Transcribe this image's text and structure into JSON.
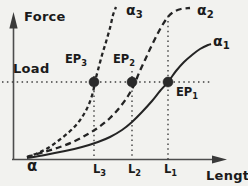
{
  "colors": {
    "background": "#f2f2ef",
    "ink": "#242424",
    "axis": "#4d4d4d",
    "dot": "#2a2a2a"
  },
  "axis_labels": {
    "y": "Force",
    "x": "Length"
  },
  "origin_label": "α",
  "curve_labels": {
    "alpha1": {
      "base": "α",
      "sub": "1"
    },
    "alpha2": {
      "base": "α",
      "sub": "2"
    },
    "alpha3": {
      "base": "α",
      "sub": "3"
    }
  },
  "point_labels": {
    "ep1": {
      "base": "EP",
      "sub": "1"
    },
    "ep2": {
      "base": "EP",
      "sub": "2"
    },
    "ep3": {
      "base": "EP",
      "sub": "3"
    }
  },
  "tick_labels": {
    "l1": {
      "base": "L",
      "sub": "1"
    },
    "l2": {
      "base": "L",
      "sub": "2"
    },
    "l3": {
      "base": "L",
      "sub": "3"
    }
  },
  "chart_data": {
    "type": "line",
    "title": "",
    "xlabel": "Length",
    "ylabel": "Force",
    "grid": false,
    "axis_numeric_scale": false,
    "load_line": {
      "label": "Load",
      "y_px": 82,
      "x1_px": 2,
      "x2_px": 212
    },
    "axis_origin_px": [
      12.5,
      159.5
    ],
    "series": [
      {
        "name": "α1",
        "style": "solid",
        "points_px": [
          [
            27,
            158
          ],
          [
            45,
            155
          ],
          [
            65,
            151
          ],
          [
            82,
            147
          ],
          [
            98,
            142
          ],
          [
            110,
            137
          ],
          [
            122,
            130
          ],
          [
            132,
            122
          ],
          [
            142,
            112
          ],
          [
            152,
            101
          ],
          [
            160,
            91
          ],
          [
            168,
            82
          ],
          [
            176,
            71
          ],
          [
            184,
            62
          ],
          [
            192,
            55
          ],
          [
            200,
            49
          ],
          [
            208,
            45
          ],
          [
            211,
            44
          ]
        ]
      },
      {
        "name": "α2",
        "style": "long-dash",
        "points_px": [
          [
            27,
            157
          ],
          [
            44,
            152
          ],
          [
            60,
            147
          ],
          [
            75,
            141
          ],
          [
            88,
            134
          ],
          [
            99,
            127
          ],
          [
            110,
            118
          ],
          [
            120,
            107
          ],
          [
            128,
            96
          ],
          [
            134,
            85
          ],
          [
            139,
            73
          ],
          [
            145,
            60
          ],
          [
            151,
            47
          ],
          [
            158,
            33
          ],
          [
            165,
            21
          ],
          [
            172,
            13
          ],
          [
            181,
            9
          ],
          [
            190,
            8
          ]
        ]
      },
      {
        "name": "α3",
        "style": "short-dash",
        "points_px": [
          [
            27,
            157
          ],
          [
            38,
            153
          ],
          [
            48,
            148
          ],
          [
            58,
            141
          ],
          [
            68,
            133
          ],
          [
            77,
            124
          ],
          [
            84,
            114
          ],
          [
            89,
            104
          ],
          [
            93,
            92
          ],
          [
            95,
            82
          ],
          [
            98,
            70
          ],
          [
            102,
            55
          ],
          [
            106,
            42
          ],
          [
            110,
            28
          ],
          [
            113,
            15
          ],
          [
            116,
            7
          ]
        ]
      }
    ],
    "equilibrium_points": [
      {
        "name": "EP3",
        "on_series": "α3",
        "x_px": 94,
        "y_px": 82
      },
      {
        "name": "EP2",
        "on_series": "α2",
        "x_px": 132,
        "y_px": 82
      },
      {
        "name": "EP1",
        "on_series": "α1",
        "x_px": 168,
        "y_px": 82
      }
    ],
    "x_guides": [
      {
        "name": "L3",
        "x_px": 94,
        "y_top_px": 76
      },
      {
        "name": "L2",
        "x_px": 132,
        "y_top_px": 71
      },
      {
        "name": "L1",
        "x_px": 168,
        "y_top_px": 16
      }
    ]
  }
}
